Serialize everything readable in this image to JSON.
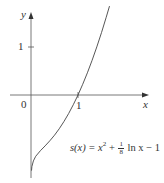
{
  "chart_data": {
    "type": "line",
    "title": "",
    "xlabel": "x",
    "ylabel": "y",
    "origin_label": "0",
    "x_ticks": [
      {
        "value": 1,
        "label": "1"
      }
    ],
    "y_ticks": [
      {
        "value": 1,
        "label": "1"
      }
    ],
    "xlim": [
      -0.6,
      2.5
    ],
    "ylim": [
      -1.7,
      1.9
    ],
    "grid": false,
    "legend": null,
    "series": [
      {
        "name": "s(x) = x^2 + (1/8) ln x - 1",
        "function": "x^2 + (1/8)*ln(x) - 1",
        "x": [
          0.01,
          0.02,
          0.05,
          0.1,
          0.2,
          0.3,
          0.4,
          0.5,
          0.6,
          0.7,
          0.8,
          0.9,
          1.0,
          1.1,
          1.2,
          1.3,
          1.4,
          1.5,
          1.6,
          1.67
        ],
        "y": [
          -1.576,
          -1.489,
          -1.372,
          -1.278,
          -1.161,
          -1.06,
          -0.955,
          -0.837,
          -0.704,
          -0.555,
          -0.388,
          -0.203,
          0.0,
          0.222,
          0.463,
          0.723,
          1.002,
          1.301,
          1.619,
          1.853
        ]
      }
    ],
    "annotations": [
      {
        "text": "s(x) = x² + ⅛ ln x − 1",
        "position": "lower right of curve"
      }
    ],
    "color": "#444444"
  },
  "labels": {
    "y_axis": "y",
    "x_axis": "x",
    "origin": "0",
    "x_tick_1": "1",
    "y_tick_1": "1",
    "formula": {
      "lhs": "s(x) = x",
      "exp": "2",
      "plus": " + ",
      "frac_num": "1",
      "frac_den": "8",
      "rest": " ln x − 1"
    }
  }
}
